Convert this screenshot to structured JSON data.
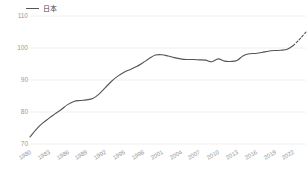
{
  "legend": {
    "position": "top-left",
    "entries": [
      {
        "label": "日本",
        "color": "#555555",
        "icon": "line-swatch"
      }
    ]
  },
  "chart_data": {
    "type": "line",
    "title": "",
    "subtitle": "",
    "xlabel": "",
    "ylabel": "",
    "grid": true,
    "grid_color": "#f0f0f0",
    "legend_position": "top-left",
    "ylim": [
      70,
      110
    ],
    "yticks": [
      70,
      80,
      90,
      100,
      110
    ],
    "ytick_labels": [
      "70",
      "80",
      "90",
      "100",
      "110"
    ],
    "xlim": [
      1980,
      2024
    ],
    "xticks": [
      1980,
      1983,
      1986,
      1989,
      1992,
      1995,
      1998,
      2001,
      2004,
      2007,
      2010,
      2013,
      2016,
      2019,
      2022
    ],
    "xtick_labels": [
      "1980",
      "1983",
      "1986",
      "1989",
      "1992",
      "1995",
      "1998",
      "2001",
      "2004",
      "2007",
      "2010",
      "2013",
      "2016",
      "2019",
      "2022"
    ],
    "series": [
      {
        "name": "日本",
        "color": "#555555",
        "x": [
          1980,
          1981,
          1982,
          1983,
          1984,
          1985,
          1986,
          1987,
          1988,
          1989,
          1990,
          1991,
          1992,
          1993,
          1994,
          1995,
          1996,
          1997,
          1998,
          1999,
          2000,
          2001,
          2002,
          2003,
          2004,
          2005,
          2006,
          2007,
          2008,
          2009,
          2010,
          2011,
          2012,
          2013,
          2014,
          2015,
          2016,
          2017,
          2018,
          2019,
          2020,
          2021,
          2022,
          2023,
          2024
        ],
        "values": [
          72.2,
          74.6,
          76.5,
          78.0,
          79.4,
          80.8,
          82.3,
          83.3,
          83.6,
          83.8,
          84.2,
          85.6,
          87.6,
          89.6,
          91.2,
          92.4,
          93.3,
          94.2,
          95.4,
          96.7,
          97.8,
          97.9,
          97.5,
          97.0,
          96.6,
          96.4,
          96.4,
          96.3,
          96.2,
          95.7,
          96.6,
          95.9,
          95.8,
          96.1,
          97.6,
          98.2,
          98.3,
          98.6,
          99.0,
          99.2,
          99.3,
          99.6,
          100.8,
          102.8,
          105.0
        ]
      }
    ],
    "forecast": {
      "style": "dashed",
      "start_x": 2022,
      "end_x": 2024,
      "note": "dashed tail segment"
    }
  }
}
